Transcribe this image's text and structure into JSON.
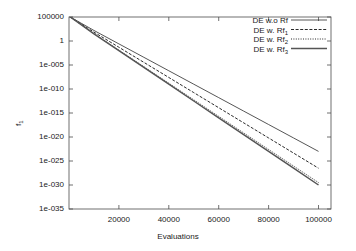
{
  "chart_data": {
    "type": "line",
    "title": "",
    "xlabel": "Evaluations",
    "ylabel": "f1",
    "ylabel_base": "f",
    "ylabel_sub": "1",
    "xlim": [
      0,
      105000
    ],
    "ylim_log10": [
      -35,
      5
    ],
    "yscale": "log",
    "grid": false,
    "legend_position": "top-right",
    "xticks": [
      20000,
      40000,
      60000,
      80000,
      100000
    ],
    "xtick_labels": [
      "20000",
      "40000",
      "60000",
      "80000",
      "100000"
    ],
    "yticks_log10": [
      5,
      0,
      -5,
      -10,
      -15,
      -20,
      -25,
      -30,
      -35
    ],
    "ytick_labels": [
      "100000",
      "1",
      "1e-005",
      "1e-010",
      "1e-015",
      "1e-020",
      "1e-025",
      "1e-030",
      "1e-035"
    ],
    "series": [
      {
        "name": "DE w.o Rf",
        "style": "solid",
        "color": "#2b2b2b",
        "x": [
          500,
          10000,
          20000,
          30000,
          40000,
          50000,
          60000,
          70000,
          80000,
          90000,
          100000
        ],
        "y_log10": [
          5.0,
          2.2,
          -0.6,
          -3.4,
          -6.2,
          -9.0,
          -11.8,
          -14.6,
          -17.4,
          -20.2,
          -23.0
        ]
      },
      {
        "name": "DE w. Rf1",
        "name_base": "DE w. Rf",
        "name_sub": "1",
        "style": "dashed",
        "color": "#2b2b2b",
        "x": [
          500,
          10000,
          20000,
          30000,
          40000,
          50000,
          60000,
          70000,
          80000,
          90000,
          100000
        ],
        "y_log10": [
          5.0,
          1.85,
          -1.3,
          -4.45,
          -7.6,
          -10.75,
          -13.9,
          -17.05,
          -20.2,
          -23.35,
          -26.5
        ]
      },
      {
        "name": "DE w. Rf2",
        "name_base": "DE w. Rf",
        "name_sub": "2",
        "style": "dotdash",
        "color": "#2b2b2b",
        "x": [
          500,
          10000,
          20000,
          30000,
          40000,
          50000,
          60000,
          70000,
          80000,
          90000,
          100000
        ],
        "y_log10": [
          5.0,
          1.55,
          -1.9,
          -5.35,
          -8.8,
          -12.25,
          -15.7,
          -19.15,
          -22.6,
          -26.05,
          -29.5
        ]
      },
      {
        "name": "DE w. Rf3",
        "name_base": "DE w. Rf",
        "name_sub": "3",
        "style": "solid-thick",
        "color": "#555555",
        "x": [
          500,
          10000,
          20000,
          30000,
          40000,
          50000,
          60000,
          70000,
          80000,
          90000,
          100000
        ],
        "y_log10": [
          5.0,
          1.5,
          -2.0,
          -5.5,
          -9.0,
          -12.5,
          -16.0,
          -19.5,
          -23.0,
          -26.5,
          -30.0
        ]
      }
    ]
  },
  "legend": {
    "entries": [
      {
        "label": "DE w.o Rf",
        "base": "DE w.o Rf",
        "sub": ""
      },
      {
        "label": "DE w. Rf1",
        "base": "DE w. Rf",
        "sub": "1"
      },
      {
        "label": "DE w. Rf2",
        "base": "DE w. Rf",
        "sub": "2"
      },
      {
        "label": "DE w. Rf3",
        "base": "DE w. Rf",
        "sub": "3"
      }
    ]
  },
  "axes": {
    "x_title": "Evaluations",
    "y_title_base": "f",
    "y_title_sub": "1"
  }
}
